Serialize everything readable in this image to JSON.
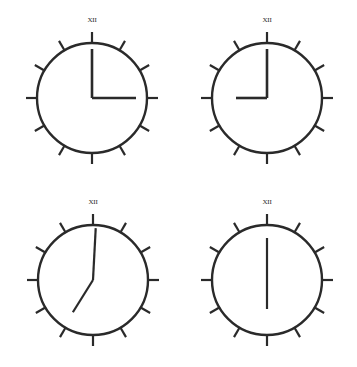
{
  "figure": {
    "background_color": "#ffffff",
    "stroke_color": "#2a2a2a",
    "width": 357,
    "height": 367,
    "numeral_label": "XII",
    "tick_count": 12
  },
  "clocks": [
    {
      "id": "clock-top-left",
      "position": "top-left",
      "center_x": 92,
      "center_y": 98,
      "radius": 55,
      "rim_stroke_width": 2.4,
      "tick_stroke_width": 2.2,
      "tick_length": 11,
      "numeral": "XII",
      "numeral_offset": 18,
      "time": "3:00",
      "hour_angle_deg": 90,
      "minute_angle_deg": 0,
      "hour_hand_length": 44,
      "minute_hand_length": 49,
      "hand_stroke_width": 2.6,
      "hands": [
        {
          "name": "minute-hand",
          "angle_deg": 0,
          "length": 49
        },
        {
          "name": "hour-hand",
          "angle_deg": 90,
          "length": 44
        }
      ]
    },
    {
      "id": "clock-top-right",
      "position": "top-right",
      "center_x": 267,
      "center_y": 98,
      "radius": 55,
      "rim_stroke_width": 2.4,
      "tick_stroke_width": 2.2,
      "tick_length": 11,
      "numeral": "XII",
      "numeral_offset": 18,
      "time": "9:00",
      "hour_angle_deg": 270,
      "minute_angle_deg": 0,
      "hour_hand_length": 31,
      "minute_hand_length": 49,
      "hand_stroke_width": 2.6,
      "hands": [
        {
          "name": "minute-hand",
          "angle_deg": 0,
          "length": 49
        },
        {
          "name": "hour-hand",
          "angle_deg": 270,
          "length": 31
        }
      ]
    },
    {
      "id": "clock-bottom-left",
      "position": "bottom-left",
      "center_x": 93,
      "center_y": 280,
      "radius": 55,
      "rim_stroke_width": 2.4,
      "tick_stroke_width": 2.2,
      "tick_length": 11,
      "numeral": "XII",
      "numeral_offset": 18,
      "time": "7:00",
      "hour_angle_deg": 212,
      "minute_angle_deg": 3,
      "hour_hand_length": 38,
      "minute_hand_length": 52,
      "hand_stroke_width": 2.2,
      "hands": [
        {
          "name": "minute-hand",
          "angle_deg": 3,
          "length": 52
        },
        {
          "name": "hour-hand",
          "angle_deg": 212,
          "length": 38
        }
      ]
    },
    {
      "id": "clock-bottom-right",
      "position": "bottom-right",
      "center_x": 267,
      "center_y": 280,
      "radius": 55,
      "rim_stroke_width": 2.4,
      "tick_stroke_width": 2.2,
      "tick_length": 11,
      "numeral": "XII",
      "numeral_offset": 18,
      "time": "6:00",
      "hour_angle_deg": 180,
      "minute_angle_deg": 0,
      "hour_hand_length": 29,
      "minute_hand_length": 42,
      "hand_stroke_width": 2.2,
      "hands": [
        {
          "name": "minute-hand",
          "angle_deg": 0,
          "length": 42
        },
        {
          "name": "hour-hand",
          "angle_deg": 180,
          "length": 29
        }
      ]
    }
  ]
}
